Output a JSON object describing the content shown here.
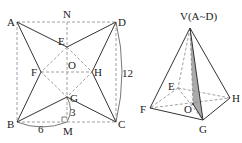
{
  "figure_left": {
    "title": "square sheet ABCD folded",
    "labels": {
      "A": "A",
      "B": "B",
      "C": "C",
      "D": "D",
      "N": "N",
      "M": "M",
      "O": "O",
      "E": "E",
      "F": "F",
      "G": "G",
      "H": "H"
    },
    "measurements": {
      "side": "12",
      "half_side": "6",
      "GM": "3"
    }
  },
  "figure_right": {
    "title": "square pyramid",
    "labels": {
      "V": "V(A~D)",
      "E": "E",
      "F": "F",
      "G": "G",
      "H": "H",
      "O": "O"
    },
    "shaded_face": "V-O-G"
  },
  "colors": {
    "line": "#333333",
    "dashed": "#888888",
    "shade": "#aaaaaa"
  }
}
